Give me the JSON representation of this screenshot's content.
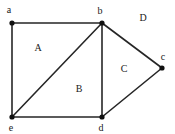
{
  "figure": {
    "type": "undirected-planar-graph",
    "width": 175,
    "height": 134,
    "background_color": "#ffffff",
    "edge_color": "#262626",
    "vertex_color": "#111111",
    "label_color": "#1a1a1a",
    "edge_width": 1.6,
    "vertex_radius": 2.6
  },
  "vertices": [
    {
      "id": "a",
      "label": "a",
      "x": 12,
      "y": 23,
      "label_x": 9,
      "label_y": 10
    },
    {
      "id": "b",
      "label": "b",
      "x": 102,
      "y": 23,
      "label_x": 100,
      "label_y": 11
    },
    {
      "id": "c",
      "label": "c",
      "x": 162,
      "y": 68,
      "label_x": 163,
      "label_y": 57
    },
    {
      "id": "d",
      "label": "d",
      "x": 102,
      "y": 117,
      "label_x": 101,
      "label_y": 128
    },
    {
      "id": "e",
      "label": "e",
      "x": 12,
      "y": 117,
      "label_x": 11,
      "label_y": 128
    }
  ],
  "edges": [
    {
      "id": "edge-a-b",
      "from": "a",
      "to": "b"
    },
    {
      "id": "edge-a-e",
      "from": "a",
      "to": "e"
    },
    {
      "id": "edge-b-e",
      "from": "b",
      "to": "e"
    },
    {
      "id": "edge-b-d",
      "from": "b",
      "to": "d"
    },
    {
      "id": "edge-b-c",
      "from": "b",
      "to": "c"
    },
    {
      "id": "edge-c-d",
      "from": "c",
      "to": "d"
    },
    {
      "id": "edge-e-d",
      "from": "e",
      "to": "d"
    }
  ],
  "regions": [
    {
      "id": "A",
      "label": "A",
      "x": 38,
      "y": 48,
      "bounded_by": [
        "a",
        "b",
        "e"
      ]
    },
    {
      "id": "B",
      "label": "B",
      "x": 79,
      "y": 89,
      "bounded_by": [
        "b",
        "d",
        "e"
      ]
    },
    {
      "id": "C",
      "label": "C",
      "x": 124,
      "y": 69,
      "bounded_by": [
        "b",
        "c",
        "d"
      ]
    },
    {
      "id": "D",
      "label": "D",
      "x": 143,
      "y": 18,
      "bounded_by": [
        "outer-face"
      ]
    }
  ]
}
